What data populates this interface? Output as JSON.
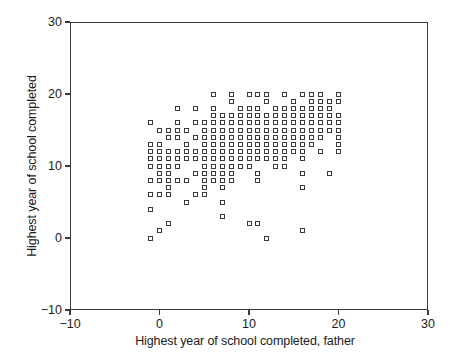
{
  "chart_data": {
    "type": "scatter",
    "title": "",
    "xlabel": "Highest year of school completed, father",
    "ylabel": "Highest year of school completed",
    "xlim": [
      -10,
      30
    ],
    "ylim": [
      -10,
      30
    ],
    "xticks": [
      -10,
      0,
      10,
      20,
      30
    ],
    "yticks": [
      -10,
      0,
      10,
      20,
      30
    ],
    "xtick_labels": [
      "-10",
      "0",
      "10",
      "20",
      "30"
    ],
    "ytick_labels": [
      "-10",
      "0",
      "10",
      "20",
      "30"
    ],
    "grid": false,
    "legend": null,
    "marker": "open-square",
    "marker_color": "#3a3a3a",
    "points": [
      [
        -1,
        16
      ],
      [
        -1,
        13
      ],
      [
        -1,
        12
      ],
      [
        -1,
        11
      ],
      [
        -1,
        10
      ],
      [
        -1,
        8
      ],
      [
        -1,
        6
      ],
      [
        -1,
        4
      ],
      [
        -1,
        0
      ],
      [
        0,
        15
      ],
      [
        0,
        13
      ],
      [
        0,
        12
      ],
      [
        0,
        11
      ],
      [
        0,
        10
      ],
      [
        0,
        9
      ],
      [
        0,
        8
      ],
      [
        0,
        6
      ],
      [
        0,
        1
      ],
      [
        1,
        15
      ],
      [
        1,
        14
      ],
      [
        1,
        12
      ],
      [
        1,
        11
      ],
      [
        1,
        10
      ],
      [
        1,
        9
      ],
      [
        1,
        8
      ],
      [
        1,
        7
      ],
      [
        1,
        6
      ],
      [
        1,
        2
      ],
      [
        2,
        18
      ],
      [
        2,
        16
      ],
      [
        2,
        15
      ],
      [
        2,
        14
      ],
      [
        2,
        12
      ],
      [
        2,
        11
      ],
      [
        2,
        10
      ],
      [
        2,
        8
      ],
      [
        3,
        15
      ],
      [
        3,
        13
      ],
      [
        3,
        12
      ],
      [
        3,
        11
      ],
      [
        3,
        8
      ],
      [
        3,
        5
      ],
      [
        4,
        18
      ],
      [
        4,
        16
      ],
      [
        4,
        14
      ],
      [
        4,
        12
      ],
      [
        4,
        11
      ],
      [
        4,
        9
      ],
      [
        4,
        6
      ],
      [
        5,
        16
      ],
      [
        5,
        15
      ],
      [
        5,
        14
      ],
      [
        5,
        13
      ],
      [
        5,
        12
      ],
      [
        5,
        11
      ],
      [
        5,
        10
      ],
      [
        5,
        9
      ],
      [
        5,
        8
      ],
      [
        5,
        7
      ],
      [
        5,
        6
      ],
      [
        6,
        20
      ],
      [
        6,
        18
      ],
      [
        6,
        17
      ],
      [
        6,
        16
      ],
      [
        6,
        15
      ],
      [
        6,
        14
      ],
      [
        6,
        13
      ],
      [
        6,
        12
      ],
      [
        6,
        11
      ],
      [
        6,
        10
      ],
      [
        6,
        9
      ],
      [
        6,
        8
      ],
      [
        7,
        17
      ],
      [
        7,
        16
      ],
      [
        7,
        15
      ],
      [
        7,
        14
      ],
      [
        7,
        13
      ],
      [
        7,
        12
      ],
      [
        7,
        11
      ],
      [
        7,
        10
      ],
      [
        7,
        9
      ],
      [
        7,
        8
      ],
      [
        7,
        7
      ],
      [
        7,
        5
      ],
      [
        7,
        3
      ],
      [
        8,
        20
      ],
      [
        8,
        19
      ],
      [
        8,
        17
      ],
      [
        8,
        16
      ],
      [
        8,
        15
      ],
      [
        8,
        14
      ],
      [
        8,
        13
      ],
      [
        8,
        12
      ],
      [
        8,
        11
      ],
      [
        8,
        10
      ],
      [
        8,
        9
      ],
      [
        8,
        8
      ],
      [
        9,
        18
      ],
      [
        9,
        17
      ],
      [
        9,
        16
      ],
      [
        9,
        15
      ],
      [
        9,
        14
      ],
      [
        9,
        13
      ],
      [
        9,
        12
      ],
      [
        9,
        11
      ],
      [
        9,
        10
      ],
      [
        10,
        20
      ],
      [
        10,
        18
      ],
      [
        10,
        17
      ],
      [
        10,
        16
      ],
      [
        10,
        15
      ],
      [
        10,
        14
      ],
      [
        10,
        13
      ],
      [
        10,
        12
      ],
      [
        10,
        11
      ],
      [
        10,
        10
      ],
      [
        10,
        2
      ],
      [
        11,
        20
      ],
      [
        11,
        18
      ],
      [
        11,
        17
      ],
      [
        11,
        16
      ],
      [
        11,
        15
      ],
      [
        11,
        14
      ],
      [
        11,
        13
      ],
      [
        11,
        12
      ],
      [
        11,
        11
      ],
      [
        11,
        9
      ],
      [
        11,
        8
      ],
      [
        11,
        2
      ],
      [
        12,
        20
      ],
      [
        12,
        19
      ],
      [
        12,
        17
      ],
      [
        12,
        16
      ],
      [
        12,
        15
      ],
      [
        12,
        14
      ],
      [
        12,
        13
      ],
      [
        12,
        12
      ],
      [
        12,
        11
      ],
      [
        12,
        0
      ],
      [
        13,
        18
      ],
      [
        13,
        17
      ],
      [
        13,
        16
      ],
      [
        13,
        15
      ],
      [
        13,
        14
      ],
      [
        13,
        13
      ],
      [
        13,
        12
      ],
      [
        13,
        11
      ],
      [
        13,
        10
      ],
      [
        14,
        20
      ],
      [
        14,
        18
      ],
      [
        14,
        17
      ],
      [
        14,
        16
      ],
      [
        14,
        15
      ],
      [
        14,
        14
      ],
      [
        14,
        13
      ],
      [
        14,
        12
      ],
      [
        14,
        11
      ],
      [
        14,
        10
      ],
      [
        15,
        19
      ],
      [
        15,
        18
      ],
      [
        15,
        17
      ],
      [
        15,
        16
      ],
      [
        15,
        15
      ],
      [
        15,
        14
      ],
      [
        15,
        13
      ],
      [
        15,
        12
      ],
      [
        16,
        20
      ],
      [
        16,
        18
      ],
      [
        16,
        17
      ],
      [
        16,
        16
      ],
      [
        16,
        15
      ],
      [
        16,
        14
      ],
      [
        16,
        13
      ],
      [
        16,
        12
      ],
      [
        16,
        11
      ],
      [
        16,
        9
      ],
      [
        16,
        7
      ],
      [
        16,
        1
      ],
      [
        17,
        20
      ],
      [
        17,
        19
      ],
      [
        17,
        18
      ],
      [
        17,
        17
      ],
      [
        17,
        16
      ],
      [
        17,
        15
      ],
      [
        17,
        14
      ],
      [
        17,
        13
      ],
      [
        18,
        20
      ],
      [
        18,
        19
      ],
      [
        18,
        18
      ],
      [
        18,
        17
      ],
      [
        18,
        16
      ],
      [
        18,
        15
      ],
      [
        18,
        14
      ],
      [
        18,
        12
      ],
      [
        19,
        19
      ],
      [
        19,
        18
      ],
      [
        19,
        17
      ],
      [
        19,
        16
      ],
      [
        19,
        15
      ],
      [
        19,
        9
      ],
      [
        20,
        20
      ],
      [
        20,
        19
      ],
      [
        20,
        17
      ],
      [
        20,
        16
      ],
      [
        20,
        15
      ],
      [
        20,
        14
      ],
      [
        20,
        13
      ],
      [
        20,
        12
      ]
    ]
  }
}
